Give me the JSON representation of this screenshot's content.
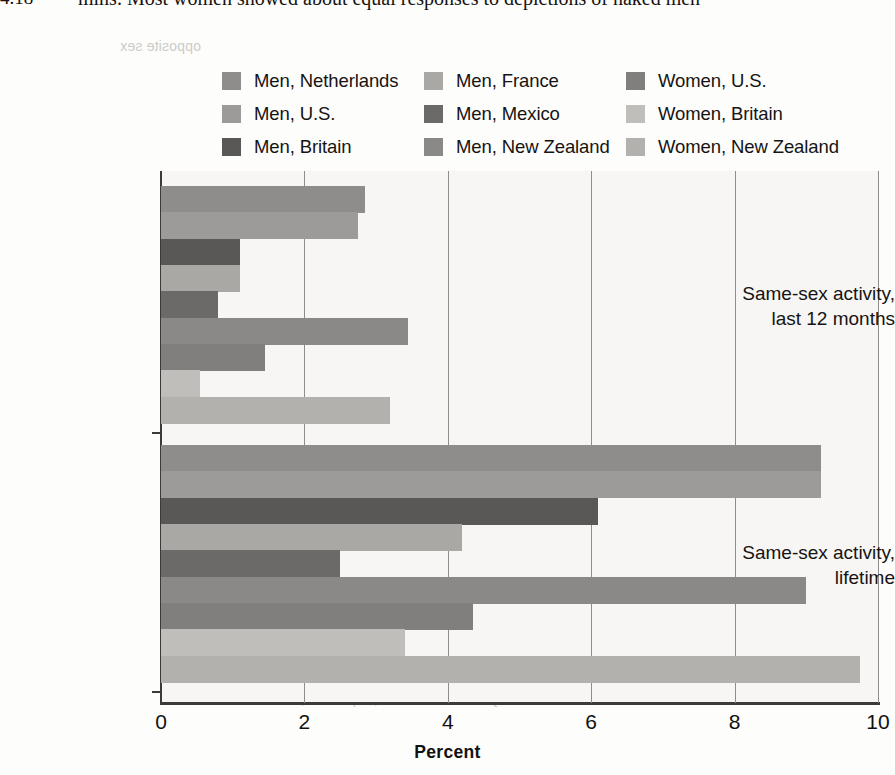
{
  "page": {
    "figure_number": "4.18",
    "running_text": "mins. Most women showed about equal responses to depictions of naked men"
  },
  "legend": {
    "columns": [
      {
        "items": [
          {
            "label": "Men, Netherlands",
            "color": "#8e8d8b"
          },
          {
            "label": "Men, U.S.",
            "color": "#9c9b99"
          },
          {
            "label": "Men, Britain",
            "color": "#595856"
          }
        ]
      },
      {
        "items": [
          {
            "label": "Men, France",
            "color": "#a9a8a5"
          },
          {
            "label": "Men, Mexico",
            "color": "#6b6a68"
          },
          {
            "label": "Men, New Zealand",
            "color": "#8a8987"
          }
        ]
      },
      {
        "items": [
          {
            "label": "Women, U.S.",
            "color": "#807f7d"
          },
          {
            "label": "Women, Britain",
            "color": "#bfbebb"
          },
          {
            "label": "Women, New Zealand",
            "color": "#b2b1ae"
          }
        ]
      }
    ]
  },
  "chart_data": {
    "type": "bar",
    "orientation": "horizontal",
    "title": "",
    "xlabel": "Percent",
    "ylabel": "",
    "xlim": [
      0,
      10
    ],
    "xticks": [
      0,
      2,
      4,
      6,
      8,
      10
    ],
    "xtick_labels": [
      "0",
      "2",
      "4",
      "6",
      "8",
      "10"
    ],
    "grid": "vertical",
    "legend_position": "top",
    "categories": [
      "Same-sex activity, last 12 months",
      "Same-sex activity, lifetime"
    ],
    "category_lines": [
      [
        "Same-sex activity,",
        "last 12 months"
      ],
      [
        "Same-sex activity,",
        "lifetime"
      ]
    ],
    "series": [
      {
        "name": "Men, Netherlands",
        "color": "#8e8d8b",
        "values": [
          2.85,
          9.2
        ]
      },
      {
        "name": "Men, U.S.",
        "color": "#9c9b99",
        "values": [
          2.75,
          9.2
        ]
      },
      {
        "name": "Men, Britain",
        "color": "#595856",
        "values": [
          1.1,
          6.1
        ]
      },
      {
        "name": "Men, France",
        "color": "#a9a8a5",
        "values": [
          1.1,
          4.2
        ]
      },
      {
        "name": "Men, Mexico",
        "color": "#6b6a68",
        "values": [
          0.8,
          2.5
        ]
      },
      {
        "name": "Men, New Zealand",
        "color": "#8a8987",
        "values": [
          3.45,
          9.0
        ]
      },
      {
        "name": "Women, U.S.",
        "color": "#807f7d",
        "values": [
          1.45,
          4.35
        ]
      },
      {
        "name": "Women, Britain",
        "color": "#bfbebb",
        "values": [
          0.55,
          3.4
        ]
      },
      {
        "name": "Women, New Zealand",
        "color": "#b2b1ae",
        "values": [
          3.2,
          9.75
        ]
      }
    ]
  },
  "ghost_text": {
    "lines": [
      {
        "text": "12. If a human fetus is exposed",
        "x": 520,
        "y": 186,
        "size": 16
      },
      {
        "text": "to very low levels of both",
        "x": 540,
        "y": 214,
        "size": 16
      },
      {
        "text": "testosterone and estradiol",
        "x": 540,
        "y": 242,
        "size": 16
      },
      {
        "text": "throughout prenatal development, how does",
        "x": 430,
        "y": 270,
        "size": 16
      },
      {
        "text": "the sexual anatomy appear?",
        "x": 500,
        "y": 298,
        "size": 16
      },
      {
        "text": "13. If a human fetus is exposed to high levels of",
        "x": 420,
        "y": 338,
        "size": 16
      },
      {
        "text": "both testosterone and estradiol throughout",
        "x": 430,
        "y": 366,
        "size": 16
      },
      {
        "text": "prenatal development, how does the sexual",
        "x": 440,
        "y": 394,
        "size": 16
      },
      {
        "text": "anatomy appear?",
        "x": 520,
        "y": 422,
        "size": 16
      },
      {
        "text": "Answers",
        "x": 620,
        "y": 452,
        "size": 15
      },
      {
        "text": "thought to be a result of prenatal hormone",
        "x": 300,
        "y": 510,
        "size": 15
      },
      {
        "text": "exposure; person's own judgment of one's own",
        "x": 280,
        "y": 538,
        "size": 15
      },
      {
        "text": "sex; 3. female; 4. male; 5. the degree to which",
        "x": 290,
        "y": 566,
        "size": 15
      },
      {
        "text": "one is sexually attracted to people of the same",
        "x": 295,
        "y": 594,
        "size": 15
      },
      {
        "text": "or opposite sex",
        "x": 430,
        "y": 622,
        "size": 15
      },
      {
        "text": "6. Homosexuality 7. a few women; 0 percent; 8. a",
        "x": 270,
        "y": 690,
        "size": 15
      },
      {
        "text": "opposite sex",
        "x": 120,
        "y": 38,
        "size": 14
      }
    ]
  }
}
